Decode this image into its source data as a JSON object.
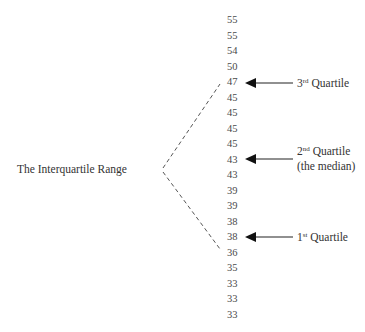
{
  "data_values": [
    "55",
    "55",
    "54",
    "50",
    "47",
    "45",
    "45",
    "45",
    "45",
    "43",
    "43",
    "39",
    "39",
    "38",
    "38",
    "36",
    "35",
    "33",
    "33",
    "33"
  ],
  "left_label": "The Interquartile Range",
  "quartiles": [
    {
      "ordinal_num": "3",
      "ordinal_suffix": "rd",
      "label": "Quartile",
      "sub": "",
      "value": "47"
    },
    {
      "ordinal_num": "2",
      "ordinal_suffix": "nd",
      "label": "Quartile",
      "sub": "(the median)",
      "value": "43"
    },
    {
      "ordinal_num": "1",
      "ordinal_suffix": "st",
      "label": "Quartile",
      "sub": "",
      "value": "38"
    }
  ]
}
